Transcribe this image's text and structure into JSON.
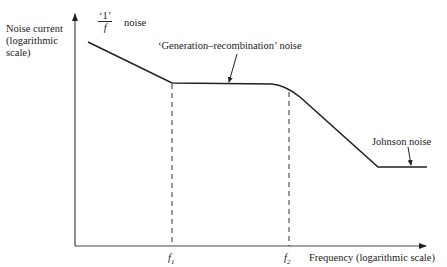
{
  "diagram": {
    "type": "noise-spectrum-sketch",
    "y_axis_label": "Noise current (logarithmic scale)",
    "x_axis_label": "Frequency (logarithmic scale)",
    "regions": [
      {
        "name": "1/f noise",
        "label_prefix": "‘1’",
        "label_fraction_den": "f",
        "label_suffix": "noise"
      },
      {
        "name": "generation-recombination",
        "label": "‘Generation–recombination’ noise"
      },
      {
        "name": "johnson",
        "label": "Johnson noise"
      }
    ],
    "markers": [
      {
        "name": "f1",
        "symbol": "f",
        "subscript": "1"
      },
      {
        "name": "f2",
        "symbol": "f",
        "subscript": "2"
      }
    ],
    "colors": {
      "ink": "#222222",
      "background": "#ffffff"
    }
  }
}
